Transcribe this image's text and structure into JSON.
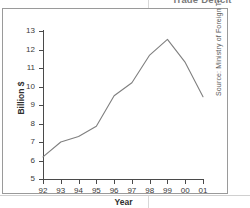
{
  "document": {
    "partial_title": "Trade Deficit",
    "source_note": "Source: Ministry of Foreign Trade"
  },
  "chart_data": {
    "type": "line",
    "title": "Trade Deficit",
    "xlabel": "Year",
    "ylabel": "Billion $",
    "categories": [
      "92",
      "93",
      "94",
      "95",
      "96",
      "97",
      "98",
      "99",
      "00",
      "01"
    ],
    "values": [
      6.2,
      7.0,
      7.3,
      7.85,
      9.5,
      10.2,
      11.7,
      12.55,
      11.3,
      9.45
    ],
    "series": [
      {
        "name": "Trade Deficit",
        "values": [
          6.2,
          7.0,
          7.3,
          7.85,
          9.5,
          10.2,
          11.7,
          12.55,
          11.3,
          9.45
        ]
      }
    ],
    "ylim": [
      5,
      13
    ],
    "yticks": [
      5,
      6,
      7,
      8,
      9,
      10,
      11,
      12,
      13
    ],
    "ytick_labels": [
      "5",
      "6",
      "7",
      "8",
      "9",
      "10",
      "11",
      "12",
      "13"
    ],
    "xtick_labels": [
      "92",
      "93",
      "94",
      "95",
      "96",
      "97",
      "98",
      "99",
      "00",
      "01"
    ],
    "grid": false,
    "legend": "none",
    "line_color": "#7f7f7f",
    "axis_color": "#4a4a4a"
  }
}
